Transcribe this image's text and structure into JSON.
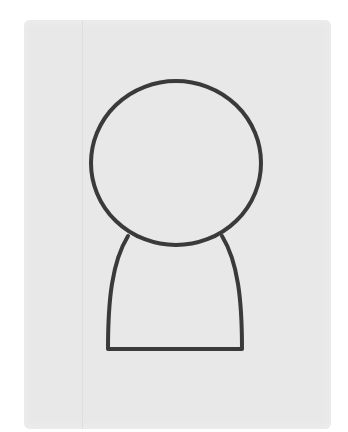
{
  "scene": {
    "description": "Simple line drawing of a person silhouette (head and shoulders) on light gray paper",
    "colors": {
      "background": "#ffffff",
      "paper": "#e8e8e8",
      "stroke": "#3a3a3a"
    },
    "shapes": {
      "head": {
        "cx": 176,
        "cy": 163,
        "rx": 86,
        "ry": 82
      },
      "body": {
        "top_left": [
          128,
          236
        ],
        "top_right": [
          222,
          236
        ],
        "bottom_left": [
          107,
          350
        ],
        "bottom_right": [
          242,
          350
        ]
      }
    }
  }
}
